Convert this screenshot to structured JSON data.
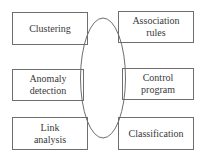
{
  "diagram": {
    "center_shape": "ellipse",
    "colors": {
      "stroke": "#6e6e6e",
      "text": "#3a3a3a",
      "background": "#ffffff"
    },
    "boxes": [
      {
        "id": "clustering",
        "label": "Clustering",
        "position": "top-left"
      },
      {
        "id": "association-rules",
        "label": "Association\nrules",
        "position": "top-right"
      },
      {
        "id": "anomaly-detection",
        "label": "Anomaly\ndetection",
        "position": "middle-left"
      },
      {
        "id": "control-program",
        "label": "Control\nprogram",
        "position": "middle-right"
      },
      {
        "id": "link-analysis",
        "label": "Link\nanalysis",
        "position": "bottom-left"
      },
      {
        "id": "classification",
        "label": "Classification",
        "position": "bottom-right"
      }
    ]
  }
}
